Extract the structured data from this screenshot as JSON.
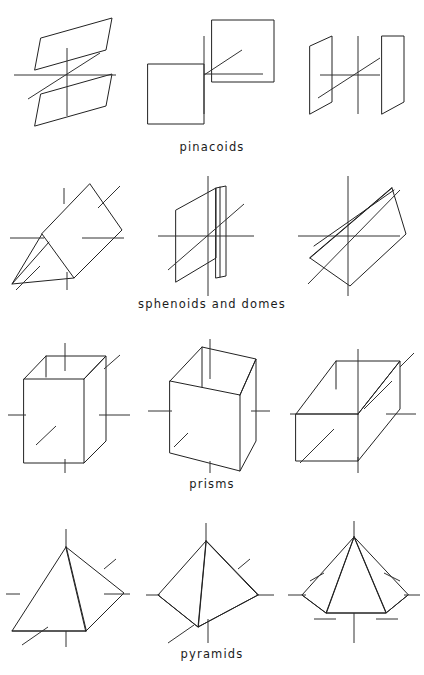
{
  "plate": {
    "width": 424,
    "height": 675,
    "background_color": "#ffffff",
    "ink_color": "#222222",
    "axis_color": "#333333",
    "description": "Crystallography plate: line drawings of crystal forms arranged in four labelled rows of three figures each, every form drawn around a cross of crystallographic axes."
  },
  "rows": [
    {
      "id": "row-pinacoids",
      "caption": "pinacoids",
      "caption_y": 146,
      "figures": [
        {
          "id": "pinacoid-basal",
          "name": "basal-pinacoid",
          "label": "",
          "x": 4,
          "y": 6,
          "width": 136,
          "height": 120
        },
        {
          "id": "pinacoid-front",
          "name": "front-pinacoid",
          "label": "",
          "x": 146,
          "y": 6,
          "width": 136,
          "height": 120
        },
        {
          "id": "pinacoid-side",
          "name": "side-pinacoid",
          "label": "",
          "x": 288,
          "y": 6,
          "width": 132,
          "height": 120
        }
      ]
    },
    {
      "id": "row-sphenoids",
      "caption": "sphenoids and domes",
      "caption_y": 303,
      "figures": [
        {
          "id": "sphenoid-left",
          "name": "sphenoid-tilted",
          "label": "",
          "x": 4,
          "y": 172,
          "width": 136,
          "height": 122
        },
        {
          "id": "dome-middle",
          "name": "dome-vertical-plane",
          "label": "",
          "x": 146,
          "y": 172,
          "width": 136,
          "height": 122
        },
        {
          "id": "sphenoid-right",
          "name": "sphenoid-inclined",
          "label": "",
          "x": 288,
          "y": 172,
          "width": 132,
          "height": 122
        }
      ]
    },
    {
      "id": "row-prisms",
      "caption": "prisms",
      "caption_y": 483,
      "figures": [
        {
          "id": "prism-orthorhombic",
          "name": "vertical-prism",
          "label": "",
          "x": 4,
          "y": 331,
          "width": 136,
          "height": 140
        },
        {
          "id": "prism-monoclinic",
          "name": "oblique-prism",
          "label": "",
          "x": 146,
          "y": 331,
          "width": 136,
          "height": 140
        },
        {
          "id": "prism-horizontal",
          "name": "horizontal-prism",
          "label": "",
          "x": 288,
          "y": 331,
          "width": 132,
          "height": 140
        }
      ]
    },
    {
      "id": "row-pyramids",
      "caption": "pyramids",
      "caption_y": 653,
      "figures": [
        {
          "id": "pyramid-oblique",
          "name": "oblique-pyramid",
          "label": "",
          "x": 4,
          "y": 515,
          "width": 136,
          "height": 130
        },
        {
          "id": "pyramid-steep",
          "name": "steep-pyramid",
          "label": "",
          "x": 146,
          "y": 515,
          "width": 136,
          "height": 130
        },
        {
          "id": "pyramid-symmetric",
          "name": "symmetric-pyramid",
          "label": "",
          "x": 288,
          "y": 515,
          "width": 132,
          "height": 130
        }
      ]
    }
  ]
}
